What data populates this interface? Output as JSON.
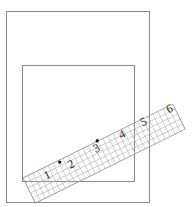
{
  "diagram": {
    "colors": {
      "frame_stroke": "#8c8c8c",
      "grid_stroke": "#b4b4b4",
      "label_fill": "#333333",
      "dot_fill": "#111111",
      "background": "#ffffff"
    },
    "outer_rect": {
      "x": 6,
      "y": 11,
      "width": 143,
      "height": 191
    },
    "inner_square": {
      "x": 22,
      "y": 65,
      "width": 112,
      "height": 116
    },
    "ruler_strip": {
      "origin_x": 23,
      "origin_y": 178,
      "angle_deg": -26.3,
      "length": 167,
      "width": 28,
      "grid_rows": 5,
      "grid_cols": 30,
      "labels": [
        {
          "text": "1",
          "u": 23,
          "v": 9
        },
        {
          "text": "2",
          "u": 49,
          "v": 10
        },
        {
          "text": "3",
          "u": 79,
          "v": 7
        },
        {
          "text": "4",
          "u": 108,
          "v": 6
        },
        {
          "text": "5",
          "u": 133,
          "v": 4
        },
        {
          "text": "6",
          "u": 162,
          "v": 4
        }
      ],
      "dots": [
        {
          "u": 40,
          "v": 2
        },
        {
          "u": 83,
          "v": -0.5
        }
      ]
    }
  }
}
